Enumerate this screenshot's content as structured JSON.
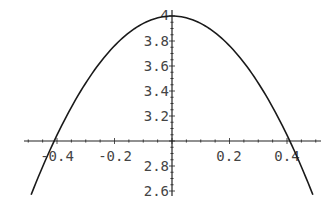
{
  "chart_data": {
    "type": "line",
    "title": "",
    "xlabel": "",
    "ylabel": "",
    "xlim": [
      -0.49,
      0.49
    ],
    "ylim": [
      2.58,
      4.0
    ],
    "axes_origin": {
      "x": 0,
      "y": 3.0
    },
    "grid": false,
    "legend": null,
    "x_ticks": [
      -0.4,
      -0.2,
      0.2,
      0.4
    ],
    "x_tick_labels": [
      "-0.4",
      "-0.2",
      "0.2",
      "0.4"
    ],
    "y_ticks": [
      2.6,
      2.8,
      3.2,
      3.4,
      3.6,
      3.8,
      4.0
    ],
    "y_tick_labels": [
      "2.6",
      "2.8",
      "3.2",
      "3.4",
      "3.6",
      "3.8",
      "4"
    ],
    "series": [
      {
        "name": "curve",
        "x": [
          -0.49,
          -0.4,
          -0.3,
          -0.2,
          -0.1,
          0.0,
          0.1,
          0.2,
          0.3,
          0.4,
          0.49
        ],
        "y": [
          2.57,
          3.05,
          3.46,
          3.76,
          3.94,
          4.0,
          3.94,
          3.76,
          3.46,
          3.05,
          2.57
        ]
      }
    ]
  },
  "colors": {
    "curve": "#1a1a1a",
    "axes": "#222222",
    "labels": "#444444",
    "background": "#ffffff"
  }
}
